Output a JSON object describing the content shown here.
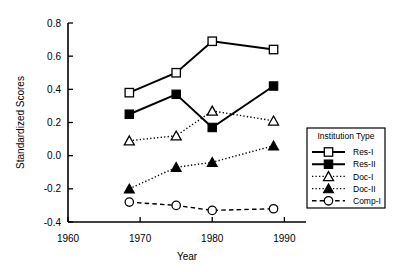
{
  "chart_data": {
    "type": "line",
    "title": "",
    "xlabel": "Year",
    "ylabel": "Standardized Scores",
    "xlim": [
      1960,
      1993
    ],
    "ylim": [
      -0.4,
      0.8
    ],
    "xticks": [
      1960,
      1970,
      1980,
      1990
    ],
    "xticklabels": [
      "1960",
      "1970",
      "1980",
      "1990"
    ],
    "yticks": [
      -0.4,
      -0.2,
      0.0,
      0.2,
      0.4,
      0.6,
      0.8
    ],
    "yticklabels": [
      "-0.4",
      "-0.2",
      "0.0",
      "0.2",
      "0.4",
      "0.6",
      "0.8"
    ],
    "grid": false,
    "legend_position": "right",
    "legend_title": "Institution Type",
    "x": [
      1968.5,
      1975.0,
      1980.0,
      1988.5
    ],
    "series": [
      {
        "name": "Res-I",
        "values": [
          0.38,
          0.5,
          0.69,
          0.64
        ],
        "marker": "open-square",
        "linestyle": "solid",
        "color": "#000000"
      },
      {
        "name": "Res-II",
        "values": [
          0.25,
          0.37,
          0.17,
          0.42
        ],
        "marker": "filled-square",
        "linestyle": "solid",
        "color": "#000000"
      },
      {
        "name": "Doc-I",
        "values": [
          0.09,
          0.12,
          0.27,
          0.21
        ],
        "marker": "open-triangle",
        "linestyle": "dotted",
        "color": "#000000"
      },
      {
        "name": "Doc-II",
        "values": [
          -0.2,
          -0.07,
          -0.04,
          0.06
        ],
        "marker": "filled-triangle",
        "linestyle": "dotted",
        "color": "#000000"
      },
      {
        "name": "Comp-I",
        "values": [
          -0.28,
          -0.3,
          -0.33,
          -0.32
        ],
        "marker": "open-circle",
        "linestyle": "dashed",
        "color": "#000000"
      }
    ]
  }
}
